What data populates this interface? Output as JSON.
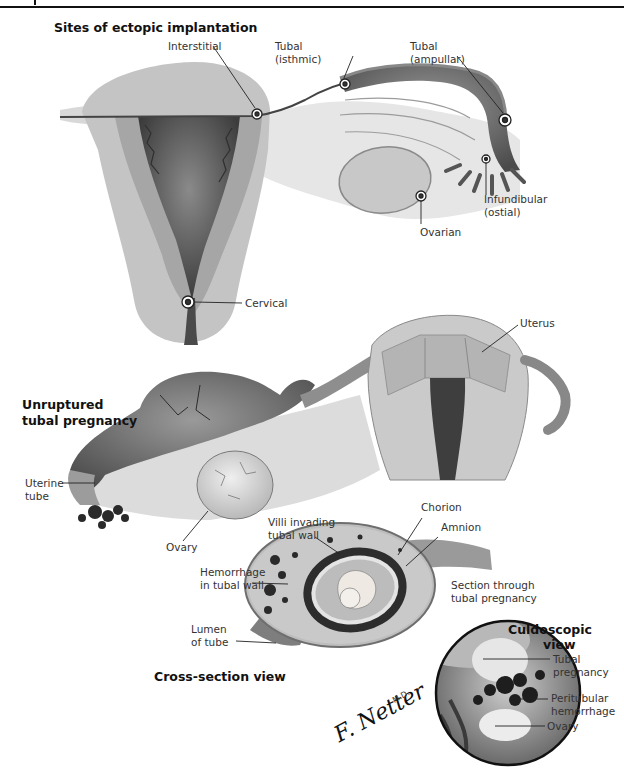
{
  "figure": {
    "sections": {
      "ectopic_sites": {
        "title": "Sites of ectopic implantation",
        "labels": {
          "interstitial": "Interstitial",
          "tubal_isthmic_line1": "Tubal",
          "tubal_isthmic_line2": "(isthmic)",
          "tubal_ampullar_line1": "Tubal",
          "tubal_ampullar_line2": "(ampullar)",
          "infundibular_line1": "Infundibular",
          "infundibular_line2": "(ostial)",
          "ovarian": "Ovarian",
          "cervical": "Cervical"
        }
      },
      "unruptured": {
        "title_line1": "Unruptured",
        "title_line2": "tubal pregnancy",
        "labels": {
          "uterus": "Uterus",
          "uterine_tube_line1": "Uterine",
          "uterine_tube_line2": "tube",
          "ovary": "Ovary"
        }
      },
      "cross_section": {
        "title": "Cross-section view",
        "labels": {
          "villi_line1": "Villi invading",
          "villi_line2": "tubal wall",
          "chorion": "Chorion",
          "amnion": "Amnion",
          "hemorrhage_line1": "Hemorrhage",
          "hemorrhage_line2": "in tubal wall",
          "section_line1": "Section through",
          "section_line2": "tubal pregnancy",
          "lumen_line1": "Lumen",
          "lumen_line2": "of tube"
        }
      },
      "culdoscopic": {
        "title_line1": "Culdoscopic",
        "title_line2": "view",
        "labels": {
          "tubal_pregnancy_line1": "Tubal",
          "tubal_pregnancy_line2": "pregnancy",
          "peritubular_line1": "Peritubular",
          "peritubular_line2": "hemorrhage",
          "ovary": "Ovary"
        }
      }
    },
    "signature": {
      "text": "F. Netter",
      "suffix": "M.D."
    }
  }
}
